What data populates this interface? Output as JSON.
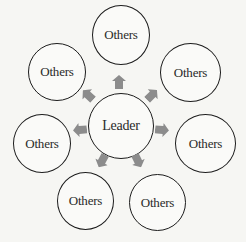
{
  "diagram": {
    "type": "radial-hub-and-spoke",
    "colors": {
      "background": "#f6f6f3",
      "node_border": "#1c1c1c",
      "node_text": "#2a2a2a",
      "arrow_fill": "#8c8c8c"
    },
    "center": {
      "label": "Leader"
    },
    "satellites": [
      {
        "label": "Others",
        "position": "top"
      },
      {
        "label": "Others",
        "position": "top-right"
      },
      {
        "label": "Others",
        "position": "right"
      },
      {
        "label": "Others",
        "position": "bottom-right"
      },
      {
        "label": "Others",
        "position": "bottom-left"
      },
      {
        "label": "Others",
        "position": "left"
      },
      {
        "label": "Others",
        "position": "top-left"
      }
    ],
    "arrows": [
      {
        "direction": "top"
      },
      {
        "direction": "top-right"
      },
      {
        "direction": "right"
      },
      {
        "direction": "bottom-right"
      },
      {
        "direction": "bottom-left"
      },
      {
        "direction": "left"
      },
      {
        "direction": "top-left"
      }
    ]
  }
}
